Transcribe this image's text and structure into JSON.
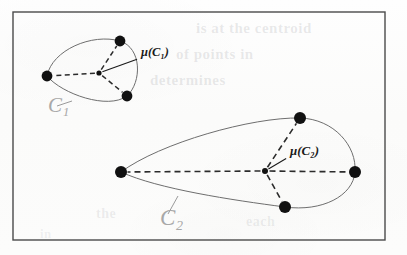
{
  "figure": {
    "frame": {
      "x": 13,
      "y": 12,
      "width": 372,
      "height": 228,
      "color": "#4a4a4a"
    },
    "background_color": "#fdfdfc",
    "point_color": "#111111",
    "outline_color": "#6e6e6e",
    "dashed_color": "#2b2b2b",
    "cluster_label_color": "#a8a8a8",
    "centroid_label_color": "#1a1a1a",
    "leader_color": "#9a9a9a"
  },
  "clusters": [
    {
      "id": "C1",
      "label": "C₁",
      "label_position": {
        "x": 48,
        "y": 112
      },
      "centroid": {
        "label": "μ(C₁)",
        "x": 99,
        "y": 73,
        "label_position": {
          "x": 141,
          "y": 56
        },
        "marker_radius": 2.6
      },
      "points": [
        {
          "x": 47,
          "y": 76,
          "radius": 5.4
        },
        {
          "x": 120,
          "y": 41,
          "radius": 5.4
        },
        {
          "x": 127,
          "y": 96,
          "radius": 5.4
        }
      ],
      "outline_path": "M 47 76 C 52 50, 92 33, 120 41 C 142 48, 142 82, 127 96 C 108 110, 62 94, 47 76 Z",
      "leader_line": {
        "x1": 72,
        "y1": 101,
        "x2": 57,
        "y2": 106
      }
    },
    {
      "id": "C2",
      "label": "C₂",
      "label_position": {
        "x": 160,
        "y": 225
      },
      "centroid": {
        "label": "μ(C₂)",
        "x": 265,
        "y": 171,
        "label_position": {
          "x": 290,
          "y": 155
        },
        "marker_radius": 3.0
      },
      "points": [
        {
          "x": 121,
          "y": 172,
          "radius": 6.0
        },
        {
          "x": 300,
          "y": 118,
          "radius": 6.0
        },
        {
          "x": 355,
          "y": 172,
          "radius": 6.0
        },
        {
          "x": 285,
          "y": 207,
          "radius": 6.0
        }
      ],
      "outline_path": "M 121 172 C 160 143, 252 117, 300 118 C 334 119, 357 146, 355 172 C 353 196, 322 212, 285 207 C 232 200, 158 189, 121 172 Z",
      "leader_line": {
        "x1": 178,
        "y1": 196,
        "x2": 168,
        "y2": 214
      }
    }
  ],
  "ghost_text": [
    {
      "id": "ghost-1",
      "text": "is at the centroid"
    },
    {
      "id": "ghost-2",
      "text": "of points in"
    },
    {
      "id": "ghost-3",
      "text": "determines"
    },
    {
      "id": "ghost-4",
      "text": "the"
    },
    {
      "id": "ghost-5",
      "text": "each"
    },
    {
      "id": "ghost-6",
      "text": "in"
    }
  ]
}
